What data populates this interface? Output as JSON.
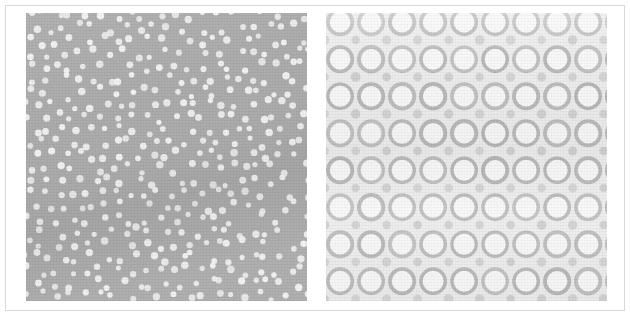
{
  "figure": {
    "frame_border_color": "#d9d9d9",
    "page_background": "#ffffff",
    "panel_count": 2
  },
  "panels": [
    {
      "id": "panel-a",
      "position": "left",
      "pattern": "disordered-dot-array",
      "description": "Quasi-random array of bright circular dots on a uniform mid-gray field",
      "background_color": "#a9a9a9",
      "feature_color": "#f2f2f2",
      "feature_shape": "filled-circle",
      "feature_diameter_px": 6.2,
      "mean_spacing_px": 14.5,
      "ordering": "short-range order, no long-range lattice",
      "feature_count": 368,
      "bounds_px": {
        "x": 20,
        "y": 14,
        "width": 281,
        "height": 288
      }
    },
    {
      "id": "panel-b",
      "position": "right",
      "pattern": "square-lattice-ring-array",
      "description": "Periodic square lattice of open rings (annuli) with small filled dots at the interstitial sites",
      "background_color": "#ebebeb",
      "ring_stroke_color": "#b4b4b4",
      "ring_fill_color": "#f7f7f7",
      "interstitial_dot_color": "#c9c9c9",
      "lattice_period_x_px": 31,
      "lattice_period_y_px": 37,
      "ring_outer_diameter_px": 28,
      "ring_stroke_width_px": 3.6,
      "interstitial_dot_diameter_px": 9,
      "ring_columns": 10,
      "ring_rows": 9,
      "ordering": "long-range periodic order",
      "bounds_px": {
        "x": 320,
        "y": 14,
        "width": 281,
        "height": 288
      }
    }
  ],
  "chart_data": {
    "type": "heatmap",
    "title": "",
    "xlabel": "",
    "ylabel": "",
    "panels": [
      {
        "label": "left",
        "kind": "dot-array micrograph",
        "background": "#a9a9a9",
        "dot_color": "#f2f2f2",
        "dot_diameter": 6.2,
        "nominal_pitch": 14.5,
        "count": 368,
        "order": "disordered"
      },
      {
        "label": "right",
        "kind": "ring-array micrograph",
        "background": "#ebebeb",
        "ring_stroke": "#b4b4b4",
        "ring_fill": "#f7f7f7",
        "interstitial_dot": "#c9c9c9",
        "pitch_x": 31,
        "pitch_y": 37,
        "ring_outer_diameter": 28,
        "stroke_width": 3.6,
        "columns": 10,
        "rows": 9,
        "order": "square lattice"
      }
    ]
  }
}
